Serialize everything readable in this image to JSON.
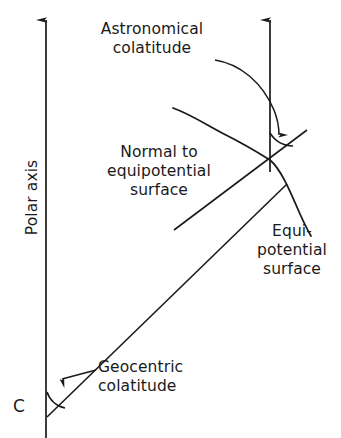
{
  "figure": {
    "type": "geodesy-colatitude-diagram",
    "width": 341,
    "height": 438,
    "background_color": "#ffffff",
    "ink_color": "#1a1a1a"
  },
  "labels": {
    "astronomical_colatitude": "Astronomical\ncolatitude",
    "normal_to_equipotential_surface": "Normal to\nequipotential\nsurface",
    "equipotential_surface": "Equi-\npotential\nsurface",
    "geocentric_colatitude": "Geocentric\ncolatitude",
    "polar_axis": "Polar axis",
    "center_point": "C"
  },
  "elements": {
    "polar_axis_line": {
      "name": "polar-axis",
      "from": [
        46,
        438
      ],
      "to": [
        46,
        16
      ],
      "arrow_head": "up"
    },
    "normal_direction_line": {
      "name": "normal-direction-arrow",
      "from": [
        270,
        160
      ],
      "to": [
        270,
        16
      ],
      "arrow_head": "up"
    },
    "geocentric_radius_line": {
      "name": "geocentric-radius",
      "from": [
        47,
        416
      ],
      "to": [
        286,
        185
      ]
    },
    "normal_line": {
      "name": "normal-to-equipotential-line",
      "from": [
        175,
        229
      ],
      "to": [
        306,
        131
      ]
    },
    "equipotential_curve": {
      "name": "equipotential-surface-curve",
      "start": [
        173,
        108
      ],
      "end": [
        311,
        236
      ]
    },
    "astronomical_angle_arc": {
      "name": "astronomical-colatitude-angle",
      "vertex": [
        270,
        160
      ],
      "radius": 26
    },
    "geocentric_angle_arc": {
      "name": "geocentric-colatitude-angle",
      "vertex": [
        47,
        416
      ],
      "radius": 24
    },
    "astronomical_pointer": {
      "name": "astronomical-colatitude-pointer-arrow",
      "from": [
        216,
        59
      ],
      "to": [
        278,
        141
      ]
    },
    "geocentric_pointer": {
      "name": "geocentric-colatitude-pointer-arrow",
      "from": [
        96,
        370
      ],
      "to": [
        56,
        382
      ]
    }
  }
}
